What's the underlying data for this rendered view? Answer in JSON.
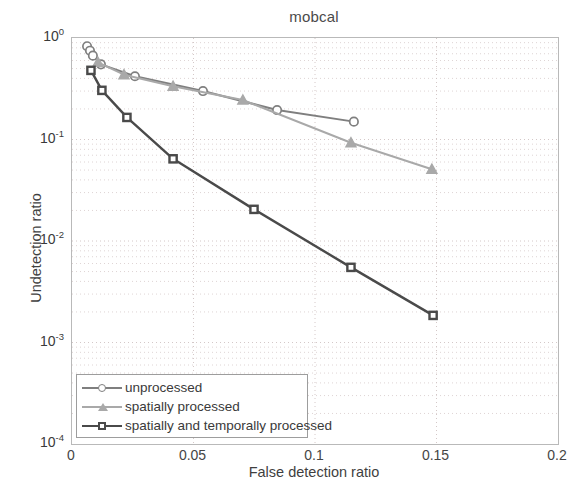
{
  "chart_data": {
    "type": "line",
    "title": "mobcal",
    "xlabel": "False detection ratio",
    "ylabel": "Undetection ratio",
    "xlim": [
      0,
      0.2
    ],
    "ylim": [
      0.0001,
      1
    ],
    "yscale": "log",
    "xscale": "linear",
    "grid": true,
    "legend_position": "lower left",
    "xticks": [
      "0",
      "0.05",
      "0.1",
      "0.15",
      "0.2"
    ],
    "xtick_values": [
      0,
      0.05,
      0.1,
      0.15,
      0.2
    ],
    "ytick_labels": [
      "10",
      "10",
      "10",
      "10",
      "10"
    ],
    "ytick_exponents": [
      "0",
      "-1",
      "-2",
      "-3",
      "-4"
    ],
    "ytick_values": [
      1,
      0.1,
      0.01,
      0.001,
      0.0001
    ],
    "series": [
      {
        "name": "unprocessed",
        "color": "#7f7f7f",
        "marker": "circle",
        "x": [
          0.0062,
          0.0074,
          0.0086,
          0.0119,
          0.0259,
          0.0539,
          0.0844,
          0.116
        ],
        "y": [
          0.83,
          0.75,
          0.67,
          0.55,
          0.42,
          0.3,
          0.195,
          0.15
        ]
      },
      {
        "name": "spatially processed",
        "color": "#a9a9a9",
        "marker": "triangle",
        "x": [
          0.0107,
          0.0214,
          0.0416,
          0.0703,
          0.1148,
          0.1481
        ],
        "y": [
          0.575,
          0.435,
          0.335,
          0.245,
          0.093,
          0.051
        ]
      },
      {
        "name": "spatially and temporally processed",
        "color": "#4a4a4a",
        "marker": "square",
        "x": [
          0.0078,
          0.0123,
          0.0226,
          0.0416,
          0.0749,
          0.1148,
          0.1486
        ],
        "y": [
          0.48,
          0.305,
          0.165,
          0.0645,
          0.0205,
          0.0055,
          0.00185
        ]
      }
    ]
  },
  "legend": {
    "items": [
      {
        "label": "unprocessed"
      },
      {
        "label": "spatially processed"
      },
      {
        "label": "spatially and temporally processed"
      }
    ]
  }
}
